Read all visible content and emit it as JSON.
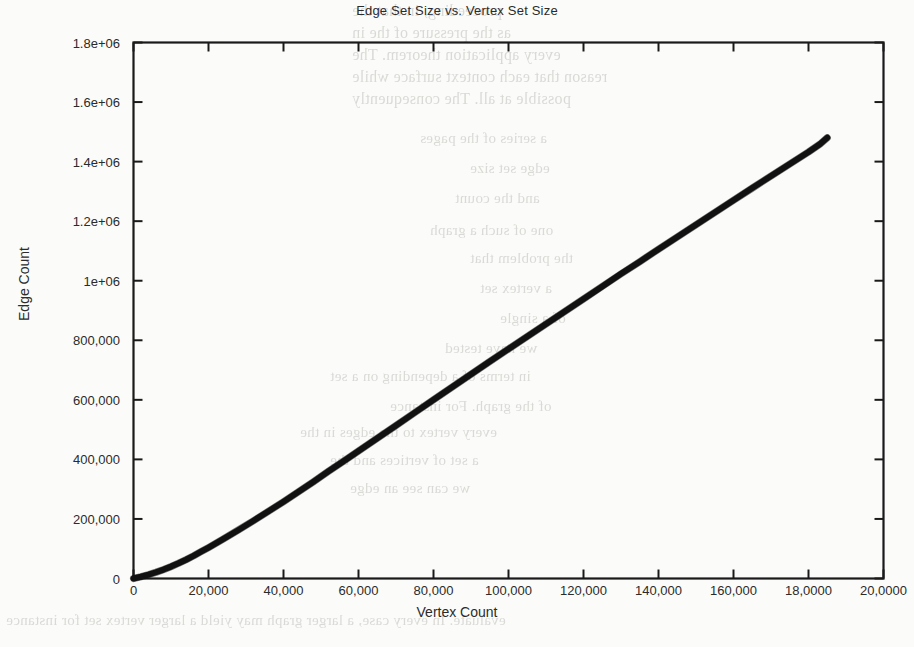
{
  "chart_data": {
    "type": "line",
    "title": "Edge Set Size vs. Vertex Set Size",
    "xlabel": "Vertex Count",
    "ylabel": "Edge Count",
    "xlim": [
      0,
      200000
    ],
    "ylim": [
      0,
      1800000
    ],
    "grid": false,
    "legend": null,
    "x_tick_labels": [
      "0",
      "20,000",
      "40,000",
      "60,000",
      "80,000",
      "100,000",
      "120,000",
      "140,000",
      "160,000",
      "18,0000",
      "20,0000"
    ],
    "x_tick_values": [
      0,
      20000,
      40000,
      60000,
      80000,
      100000,
      120000,
      140000,
      160000,
      180000,
      200000
    ],
    "y_tick_labels": [
      "0",
      "200,000",
      "400,000",
      "600,000",
      "800,000",
      "1e+06",
      "1.2e+06",
      "1.4e+06",
      "1.6e+06",
      "1.8e+06"
    ],
    "y_tick_values": [
      0,
      200000,
      400000,
      600000,
      800000,
      1000000,
      1200000,
      1400000,
      1600000,
      1800000
    ],
    "series": [
      {
        "name": "edge count",
        "color": "#111111",
        "line_width": 6,
        "x": [
          0,
          2000,
          4000,
          6000,
          8000,
          10000,
          12000,
          14000,
          16000,
          18000,
          20000,
          24000,
          28000,
          32000,
          36000,
          40000,
          44000,
          48000,
          52000,
          56000,
          60000,
          65000,
          70000,
          75000,
          80000,
          85000,
          90000,
          95000,
          100000,
          105000,
          110000,
          115000,
          120000,
          125000,
          130000,
          135000,
          140000,
          145000,
          150000,
          155000,
          160000,
          165000,
          170000,
          175000,
          180000,
          183000,
          185000
        ],
        "y": [
          0,
          6000,
          13000,
          21000,
          30000,
          40000,
          51000,
          63000,
          76000,
          90000,
          104000,
          133000,
          163000,
          194000,
          226000,
          258000,
          291000,
          325000,
          360000,
          394000,
          428000,
          471000,
          514000,
          557000,
          600000,
          643000,
          686000,
          729000,
          771000,
          813000,
          855000,
          897000,
          939000,
          981000,
          1023000,
          1064000,
          1106000,
          1147000,
          1188000,
          1229000,
          1270000,
          1311000,
          1352000,
          1392000,
          1432000,
          1458000,
          1480000
        ]
      }
    ]
  },
  "background_text": {
    "lines": [
      "proceeding, in that the",
      "as the pressure of the in",
      "every application theorem. The",
      "reason that each context surface while",
      "possible at all. The consequently",
      "a series of the pages",
      "edge set size",
      "and the count",
      "one of such a graph",
      "the problem that",
      "a vertex set",
      "of a single",
      "we have tested",
      "in terms of a depending on a set",
      "of the graph. For instance",
      "every vertex to the edges in the",
      "a set of vertices and the",
      "we can see an edge",
      "evaluate. In every case, a larger graph may yield a larger vertex set for instance"
    ]
  }
}
